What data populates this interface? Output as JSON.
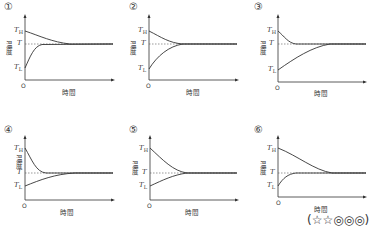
{
  "panels": [
    {
      "number": "①",
      "y_label": "温度",
      "x_label": "時間",
      "origin": "O",
      "labels": {
        "high": "T",
        "high_sub": "H",
        "mid": "T",
        "low": "T",
        "low_sub": "L"
      },
      "description": "Hot curve decays slowly; cold curve rises quickly to T"
    },
    {
      "number": "②",
      "y_label": "温度",
      "x_label": "時間",
      "origin": "O",
      "labels": {
        "high": "T",
        "high_sub": "H",
        "mid": "T",
        "low": "T",
        "low_sub": "L"
      },
      "description": "Hot and cold curves converge symmetrically at same rate"
    },
    {
      "number": "③",
      "y_label": "温度",
      "x_label": "時間",
      "origin": "O",
      "labels": {
        "high": "T",
        "high_sub": "H",
        "mid": "T",
        "low": "T",
        "low_sub": "L"
      },
      "description": "Hot curve drops quickly; cold curve rises slowly"
    },
    {
      "number": "④",
      "y_label": "温度",
      "x_label": "時間",
      "origin": "O",
      "labels": {
        "high": "T",
        "high_sub": "H",
        "mid": "T",
        "low": "T",
        "low_sub": "L"
      },
      "description": "Hot far above T drops quickly; cold slightly below rises slowly"
    },
    {
      "number": "⑤",
      "y_label": "温度",
      "x_label": "時間",
      "origin": "O",
      "labels": {
        "high": "T",
        "high_sub": "H",
        "mid": "T",
        "low": "T",
        "low_sub": "L"
      },
      "description": "Hot far above T and cold slightly below converge at same time"
    },
    {
      "number": "⑥",
      "y_label": "温度",
      "x_label": "時間",
      "origin": "O",
      "labels": {
        "high": "T",
        "high_sub": "H",
        "mid": "T",
        "low": "T",
        "low_sub": "L"
      },
      "description": "Hot far above T drops slowly; cold slightly below rises quickly"
    }
  ],
  "rating": "(☆☆◎◎◎)"
}
